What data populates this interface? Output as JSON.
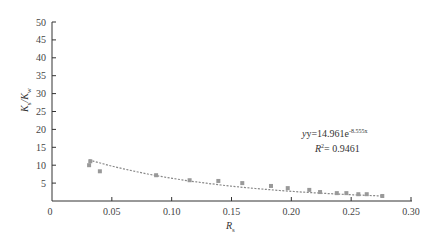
{
  "chart_data": {
    "type": "scatter",
    "title": "",
    "xlabel": "R_s",
    "ylabel": "K_s/K_w",
    "xlim": [
      0,
      0.3
    ],
    "ylim": [
      0,
      50
    ],
    "x_ticks": [
      "0",
      "0.05",
      "0.10",
      "0.15",
      "0.20",
      "0.25",
      "0.30"
    ],
    "y_ticks": [
      "5",
      "10",
      "15",
      "20",
      "25",
      "30",
      "35",
      "40",
      "45",
      "50"
    ],
    "grid": false,
    "series": [
      {
        "name": "data",
        "marker": "square",
        "color": "#999999",
        "x": [
          0.031,
          0.032,
          0.04,
          0.087,
          0.115,
          0.139,
          0.159,
          0.183,
          0.197,
          0.215,
          0.224,
          0.238,
          0.246,
          0.256,
          0.263,
          0.276
        ],
        "y": [
          10.0,
          11.1,
          8.3,
          7.2,
          5.8,
          5.6,
          5.0,
          4.2,
          3.6,
          3.1,
          2.5,
          2.2,
          2.2,
          1.9,
          1.9,
          1.4
        ]
      },
      {
        "name": "exponential fit",
        "style": "dotted",
        "color": "#888888",
        "equation": {
          "a": 14.961,
          "b": -8.555
        }
      }
    ],
    "annotations": {
      "equation_prefix": "y=14.961e",
      "equation_exponent": "-8.555x",
      "r2_prefix": "R",
      "r2_sup": "2",
      "r2_value": "= 0.9461"
    }
  },
  "labels": {
    "x_main": "R",
    "x_sub": "s",
    "y_main1": "K",
    "y_sub1": "s",
    "y_sep": "/K",
    "y_sub2": "w"
  }
}
